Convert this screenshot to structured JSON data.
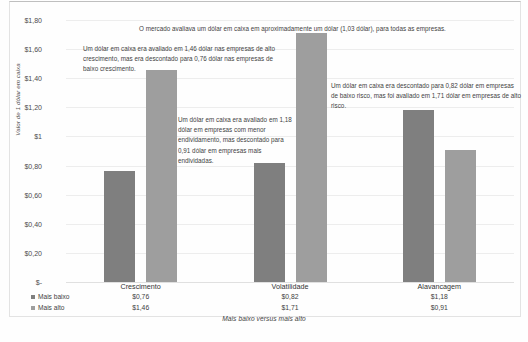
{
  "chart_data": {
    "type": "bar",
    "title": "",
    "xlabel": "Mais baixo versus mais alto",
    "ylabel": "Valor de 1 dólar em caixa",
    "categories": [
      "Crescimento",
      "Volatilidade",
      "Alavancagem"
    ],
    "series": [
      {
        "name": "Mais baixo",
        "color": "#7f7f7f",
        "values": [
          0.76,
          0.82,
          1.18
        ]
      },
      {
        "name": "Mais alto",
        "color": "#9e9e9e",
        "values": [
          1.46,
          1.71,
          0.91
        ]
      }
    ],
    "value_labels": {
      "Mais baixo": [
        "$0,76",
        "$0,82",
        "$1,18"
      ],
      "Mais alto": [
        "$1,46",
        "$1,71",
        "$0,91"
      ]
    },
    "ylim": [
      0,
      1.8
    ],
    "ytick_values": [
      1.8,
      1.6,
      1.4,
      1.2,
      1.0,
      0.8,
      0.6,
      0.4,
      0.2,
      0
    ],
    "ytick_labels": [
      "$1,80",
      "$1,60",
      "$1,40",
      "$1,20",
      "$1",
      "$0,80",
      "$0,60",
      "$0,40",
      "$0,20",
      "$-"
    ],
    "grid": true,
    "legend_position": "bottom-left",
    "annotations": [
      {
        "id": "top",
        "text": "O mercado avaliava um dólar em caixa em aproximadamente um dólar (1,03 dólar), para todas as empresas."
      },
      {
        "id": "growth",
        "text": "Um dólar em caixa era avaliado em 1,46 dólar nas empresas de alto crescimento, mas era descontado para 0,76 dólar nas empresas de baixo crescimento."
      },
      {
        "id": "debt",
        "text": "Um dólar em caixa era avaliado em 1,18 dólar em empresas com menor endividamento, mas descontado para 0,91 dólar em empresas mais endividadas."
      },
      {
        "id": "risk",
        "text": "Um dólar em caixa era descontado para 0,82 dólar em empresas de baixo risco, mas foi avaliado em 1,71 dólar em empresas de alto risco."
      }
    ]
  }
}
